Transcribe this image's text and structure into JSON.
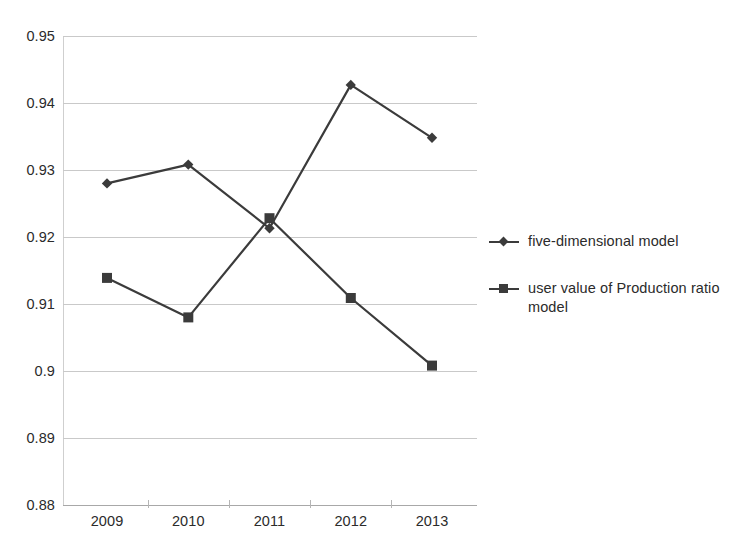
{
  "chart_data": {
    "type": "line",
    "title": "",
    "subtitle": "",
    "xlabel": "",
    "ylabel": "",
    "categories": [
      "2009",
      "2010",
      "2011",
      "2012",
      "2013"
    ],
    "series": [
      {
        "name": "five-dimensional model",
        "marker": "diamond",
        "color": "#3b3b3b",
        "values": [
          0.928,
          0.9308,
          0.9213,
          0.9427,
          0.9348
        ]
      },
      {
        "name": "user value of Production ratio model",
        "marker": "square",
        "color": "#3b3b3b",
        "values": [
          0.9139,
          0.908,
          0.9228,
          0.9109,
          0.9008
        ]
      }
    ],
    "ylim": [
      0.88,
      0.95
    ],
    "ytick_labels": [
      "0.95",
      "0.94",
      "0.93",
      "0.92",
      "0.91",
      "0.9",
      "0.89",
      "0.88"
    ],
    "ytick_values": [
      0.95,
      0.94,
      0.93,
      0.92,
      0.91,
      0.9,
      0.89,
      0.88
    ],
    "grid": true,
    "legend_position": "right"
  },
  "legend": {
    "entries": [
      {
        "label": "five-dimensional model"
      },
      {
        "label": "user value of Production ratio model"
      }
    ]
  }
}
